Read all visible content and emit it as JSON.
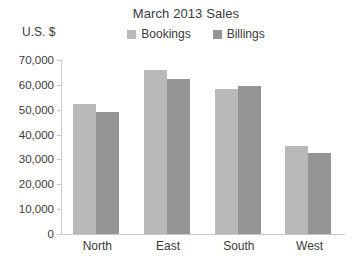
{
  "chart_data": {
    "type": "bar",
    "title": "March 2013 Sales",
    "xlabel": "",
    "ylabel": "U.S. $",
    "categories": [
      "North",
      "East",
      "South",
      "West"
    ],
    "series": [
      {
        "name": "Bookings",
        "color": "#b9b9b9",
        "values": [
          52500,
          66000,
          58500,
          35500
        ]
      },
      {
        "name": "Billings",
        "color": "#959595",
        "values": [
          49000,
          62500,
          59500,
          32500
        ]
      }
    ],
    "ylim": [
      0,
      70000
    ],
    "y_ticks": [
      0,
      10000,
      20000,
      30000,
      40000,
      50000,
      60000,
      70000
    ],
    "y_tick_labels": [
      "0",
      "10,000",
      "20,000",
      "30,000",
      "40,000",
      "50,000",
      "60,000",
      "70,000"
    ],
    "grid": false,
    "legend_position": "top-center"
  }
}
